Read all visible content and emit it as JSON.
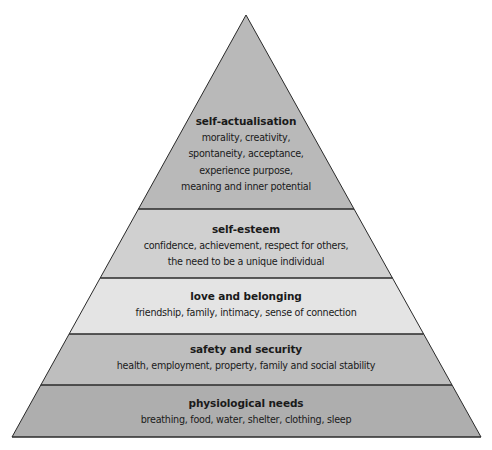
{
  "diagram": {
    "type": "pyramid",
    "geometry": {
      "apex": [
        246,
        15
      ],
      "base_left": [
        12,
        437
      ],
      "base_right": [
        481,
        437
      ],
      "band_boundaries_y": [
        15,
        209,
        278,
        334,
        385,
        437
      ]
    },
    "levels": [
      {
        "title": "self-actualisation",
        "lines": [
          "morality, creativity,",
          "spontaneity, acceptance,",
          "experience purpose,",
          "meaning and inner potential"
        ],
        "color": "#b9b9b9",
        "text_top": 113
      },
      {
        "title": "self-esteem",
        "lines": [
          "confidence, achievement, respect for others,",
          "the need to be a unique individual"
        ],
        "color": "#d0d0d0",
        "text_top": 221
      },
      {
        "title": "love and belonging",
        "lines": [
          "friendship, family, intimacy, sense of connection"
        ],
        "color": "#e4e4e4",
        "text_top": 288
      },
      {
        "title": "safety and security",
        "lines": [
          "health, employment, property, family and social stability"
        ],
        "color": "#bebebe",
        "text_top": 341
      },
      {
        "title": "physiological needs",
        "lines": [
          "breathing, food, water, shelter, clothing, sleep"
        ],
        "color": "#aeaeae",
        "text_top": 395
      }
    ],
    "stroke_color": "#2a2a2a"
  }
}
